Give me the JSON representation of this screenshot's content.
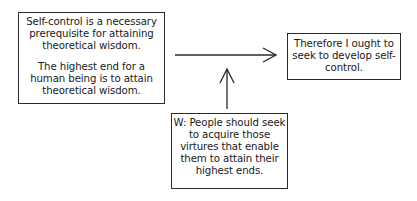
{
  "diagram": {
    "premises": {
      "lines": [
        "Self-control is a necessary prerequisite for attaining theoretical wisdom.",
        "The highest end for a human being is to attain theoretical wisdom."
      ]
    },
    "conclusion": {
      "text": "Therefore I ought to seek to develop self-control."
    },
    "warrant": {
      "text": "W: People should seek to acquire those virtures that enable them to attain their highest ends."
    },
    "arrows": [
      {
        "from": "premises",
        "to": "conclusion"
      },
      {
        "from": "warrant",
        "to": "inference-arrow"
      }
    ]
  }
}
